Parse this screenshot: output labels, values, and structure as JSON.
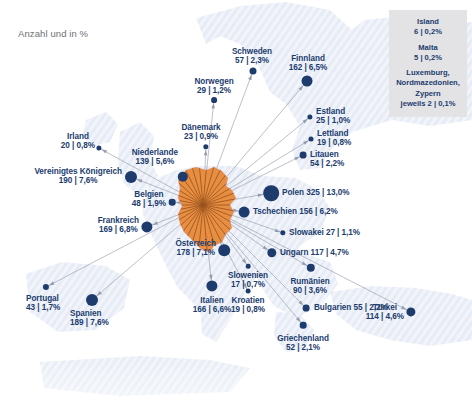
{
  "caption": "Anzahl und in %",
  "colors": {
    "dot": "#1d3c6d",
    "text": "#1c3c6e",
    "germany": "#e58a3c",
    "germany_rays": "#8c4a18",
    "map_land": "#dfe6f2",
    "map_sea": "#ffffff",
    "legend_bg": "#e3e3e5",
    "caption_text": "#6f6f72",
    "link_line": "#8f97a8"
  },
  "chart_data": {
    "type": "map",
    "title": "Anzahl und in %",
    "unit": "Anzahl | Anteil in %",
    "hub": {
      "name": "Deutschland",
      "x": 203,
      "y": 205
    },
    "categories": [
      "Irland",
      "Vereinigtes Königreich",
      "Niederlande",
      "Belgien",
      "Frankreich",
      "Portugal",
      "Spanien",
      "Norwegen",
      "Dänemark",
      "Schweden",
      "Finnland",
      "Estland",
      "Lettland",
      "Litauen",
      "Polen",
      "Tschechien",
      "Slowakei",
      "Österreich",
      "Ungarn",
      "Slowenien",
      "Kroatien",
      "Italien",
      "Rumänien",
      "Bulgarien",
      "Griechenland",
      "Türkei",
      "Island",
      "Malta",
      "Luxemburg",
      "Nordmazedonien",
      "Zypern"
    ],
    "values": [
      20,
      190,
      139,
      48,
      169,
      43,
      189,
      29,
      23,
      57,
      162,
      25,
      19,
      54,
      325,
      156,
      27,
      178,
      117,
      17,
      19,
      166,
      90,
      55,
      52,
      114,
      6,
      5,
      2,
      2,
      2
    ],
    "percentages": [
      0.8,
      7.6,
      5.6,
      1.9,
      6.8,
      1.7,
      7.6,
      1.2,
      0.9,
      2.3,
      6.5,
      1.0,
      0.8,
      2.2,
      13.0,
      6.2,
      1.1,
      7.1,
      4.7,
      0.7,
      0.8,
      6.6,
      3.6,
      2.2,
      2.1,
      4.6,
      0.2,
      0.2,
      0.1,
      0.1,
      0.1
    ]
  },
  "countries": [
    {
      "name": "Irland",
      "value": "20 | 0,8%",
      "count": 20,
      "pct": "0,8%",
      "dot": {
        "x": 99,
        "y": 148,
        "r": 2.6
      },
      "label": {
        "x": 95,
        "y": 132,
        "align": "r"
      }
    },
    {
      "name": "Vereinigtes Königreich",
      "value": "190 | 7,6%",
      "count": 190,
      "pct": "7,6%",
      "dot": {
        "x": 131,
        "y": 177,
        "r": 6.0
      },
      "label": {
        "x": 122,
        "y": 167,
        "align": "r"
      }
    },
    {
      "name": "Niederlande",
      "value": "139 | 5,6%",
      "count": 139,
      "pct": "5,6%",
      "dot": {
        "x": 183,
        "y": 177,
        "r": 5.2
      },
      "label": {
        "x": 178,
        "y": 148,
        "align": "r"
      }
    },
    {
      "name": "Belgien",
      "value": "48 | 1,9%",
      "count": 48,
      "pct": "1,9%",
      "dot": {
        "x": 172,
        "y": 202,
        "r": 3.3
      },
      "label": {
        "x": 166,
        "y": 190,
        "align": "r"
      }
    },
    {
      "name": "Frankreich",
      "value": "169 | 6,8%",
      "count": 169,
      "pct": "6,8%",
      "dot": {
        "x": 147,
        "y": 227,
        "r": 5.6
      },
      "label": {
        "x": 139,
        "y": 216,
        "align": "r"
      }
    },
    {
      "name": "Portugal",
      "value": "43 | 1,7%",
      "count": 43,
      "pct": "1,7%",
      "dot": {
        "x": 46,
        "y": 287,
        "r": 3.1
      },
      "label": {
        "x": 26,
        "y": 294,
        "align": "l"
      }
    },
    {
      "name": "Spanien",
      "value": "189 | 7,6%",
      "count": 189,
      "pct": "7,6%",
      "dot": {
        "x": 92,
        "y": 300,
        "r": 6.0
      },
      "label": {
        "x": 70,
        "y": 309,
        "align": "l"
      }
    },
    {
      "name": "Norwegen",
      "value": "29 | 1,2%",
      "count": 29,
      "pct": "1,2%",
      "dot": {
        "x": 214,
        "y": 100,
        "r": 2.9
      },
      "label": {
        "x": 214,
        "y": 77,
        "align": "c"
      }
    },
    {
      "name": "Dänemark",
      "value": "23 | 0,9%",
      "count": 23,
      "pct": "0,9%",
      "dot": {
        "x": 206,
        "y": 147,
        "r": 2.7
      },
      "label": {
        "x": 201,
        "y": 123,
        "align": "c"
      }
    },
    {
      "name": "Schweden",
      "value": "57 | 2,3%",
      "count": 57,
      "pct": "2,3%",
      "dot": {
        "x": 253,
        "y": 71,
        "r": 3.5
      },
      "label": {
        "x": 252,
        "y": 47,
        "align": "c"
      }
    },
    {
      "name": "Finnland",
      "value": "162 | 6,5%",
      "count": 162,
      "pct": "6,5%",
      "dot": {
        "x": 307,
        "y": 81,
        "r": 5.5
      },
      "label": {
        "x": 308,
        "y": 54,
        "align": "c"
      }
    },
    {
      "name": "Estland",
      "value": "25 | 1,0%",
      "count": 25,
      "pct": "1,0%",
      "dot": {
        "x": 310,
        "y": 117,
        "r": 2.6
      },
      "label": {
        "x": 316,
        "y": 107,
        "align": "l"
      }
    },
    {
      "name": "Lettland",
      "value": "19 | 0,8%",
      "count": 19,
      "pct": "0,8%",
      "dot": {
        "x": 311,
        "y": 139,
        "r": 2.5
      },
      "label": {
        "x": 317,
        "y": 129,
        "align": "l"
      }
    },
    {
      "name": "Litauen",
      "value": "54 | 2,2%",
      "count": 54,
      "pct": "2,2%",
      "dot": {
        "x": 303,
        "y": 155,
        "r": 3.4
      },
      "label": {
        "x": 310,
        "y": 150,
        "align": "l"
      }
    },
    {
      "name": "Polen",
      "value": "325 | 13,0%",
      "count": 325,
      "pct": "13,0%",
      "dot": {
        "x": 271,
        "y": 193,
        "r": 7.8
      },
      "label": {
        "x": 282,
        "y": 188,
        "align": "l",
        "inline": true
      }
    },
    {
      "name": "Tschechien",
      "value": "156 | 6,2%",
      "count": 156,
      "pct": "6,2%",
      "dot": {
        "x": 244,
        "y": 212,
        "r": 5.4
      },
      "label": {
        "x": 253,
        "y": 207,
        "align": "l",
        "inline": true
      }
    },
    {
      "name": "Slowakei",
      "value": "27 | 1,1%",
      "count": 27,
      "pct": "1,1%",
      "dot": {
        "x": 283,
        "y": 233,
        "r": 2.7
      },
      "label": {
        "x": 289,
        "y": 228,
        "align": "l",
        "inline": true
      }
    },
    {
      "name": "Österreich",
      "value": "178 | 7,1%",
      "count": 178,
      "pct": "7,1%",
      "dot": {
        "x": 224,
        "y": 250,
        "r": 5.8
      },
      "label": {
        "x": 216,
        "y": 239,
        "align": "r"
      }
    },
    {
      "name": "Ungarn",
      "value": "117 | 4,7%",
      "count": 117,
      "pct": "4,7%",
      "dot": {
        "x": 272,
        "y": 253,
        "r": 4.7
      },
      "label": {
        "x": 280,
        "y": 248,
        "align": "l",
        "inline": true
      }
    },
    {
      "name": "Slowenien",
      "value": "17 | 0,7%",
      "count": 17,
      "pct": "0,7%",
      "dot": {
        "x": 248,
        "y": 266,
        "r": 2.3
      },
      "label": {
        "x": 248,
        "y": 271,
        "align": "c"
      }
    },
    {
      "name": "Kroatien",
      "value": "19 | 0,8%",
      "count": 19,
      "pct": "0,8%",
      "dot": {
        "x": 248,
        "y": 291,
        "r": 2.4
      },
      "label": {
        "x": 248,
        "y": 296,
        "align": "c"
      }
    },
    {
      "name": "Italien",
      "value": "166 | 6,6%",
      "count": 166,
      "pct": "6,6%",
      "dot": {
        "x": 212,
        "y": 286,
        "r": 5.6
      },
      "label": {
        "x": 212,
        "y": 296,
        "align": "c"
      }
    },
    {
      "name": "Rumänien",
      "value": "90 | 3,6%",
      "count": 90,
      "pct": "3,6%",
      "dot": {
        "x": 311,
        "y": 268,
        "r": 4.2
      },
      "label": {
        "x": 310,
        "y": 277,
        "align": "c"
      }
    },
    {
      "name": "Bulgarien",
      "value": "55 | 2,2%",
      "count": 55,
      "pct": "2,2%",
      "dot": {
        "x": 306,
        "y": 308,
        "r": 3.4
      },
      "label": {
        "x": 314,
        "y": 303,
        "align": "l",
        "inline": true
      }
    },
    {
      "name": "Griechenland",
      "value": "52 | 2,1%",
      "count": 52,
      "pct": "2,1%",
      "dot": {
        "x": 303,
        "y": 325,
        "r": 3.3
      },
      "label": {
        "x": 303,
        "y": 334,
        "align": "c"
      }
    },
    {
      "name": "Türkei",
      "value": "114 | 4,6%",
      "count": 114,
      "pct": "4,6%",
      "dot": {
        "x": 411,
        "y": 312,
        "r": 4.6
      },
      "label": {
        "x": 404,
        "y": 303,
        "align": "r"
      }
    }
  ],
  "legend_box": {
    "entries": [
      {
        "name": "Island",
        "value": "6 | 0,2%"
      },
      {
        "name": "Malta",
        "value": "5 | 0,2%"
      }
    ],
    "group": {
      "names": [
        "Luxemburg,",
        "Nordmazedonien,",
        "Zypern"
      ],
      "value": "jeweils 2 | 0,1%"
    }
  }
}
